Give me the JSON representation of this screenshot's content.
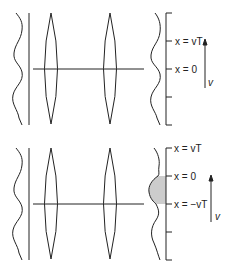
{
  "figure": {
    "colors": {
      "stroke": "#222222",
      "shade": "#cccccc",
      "background": "#ffffff"
    }
  },
  "top_panel": {
    "labels": {
      "tick_vT": "x = vT",
      "tick_zero": "x = 0",
      "velocity": "v"
    }
  },
  "bottom_panel": {
    "labels": {
      "tick_vT": "x = vT",
      "tick_zero": "x = 0",
      "tick_neg_vT": "x = −vT",
      "velocity": "v"
    },
    "shaded_region": "between x = 0 and x = −vT"
  }
}
